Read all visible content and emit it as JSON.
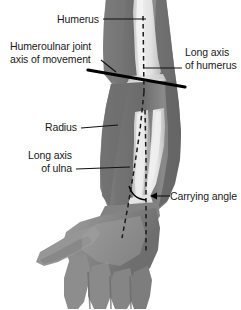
{
  "figure": {
    "background_color": "#ffffff",
    "width": 241,
    "height": 310
  },
  "labels": {
    "humerus": "Humerus",
    "humeroulnar_line1": "Humeroulnar joint",
    "humeroulnar_line2": "axis of movement",
    "long_axis_humerus_line1": "Long axis",
    "long_axis_humerus_line2": "of humerus",
    "radius": "Radius",
    "long_axis_ulna_line1": "Long axis",
    "long_axis_ulna_line2": "of ulna",
    "carrying_angle": "Carrying angle"
  },
  "colors": {
    "skin_dark": "#6f6f6f",
    "skin_mid": "#8a8a8a",
    "skin_light": "#a3a3a3",
    "skin_highlight": "#bdbdbd",
    "bone_light": "#ededed",
    "bone_mid": "#d2d2d2",
    "bone_shadow": "#b0b0b0",
    "line_black": "#000000",
    "text": "#1a1a1a"
  },
  "anatomy": {
    "structures": [
      "humerus",
      "radius",
      "ulna",
      "elbow-joint",
      "forearm",
      "hand"
    ]
  }
}
